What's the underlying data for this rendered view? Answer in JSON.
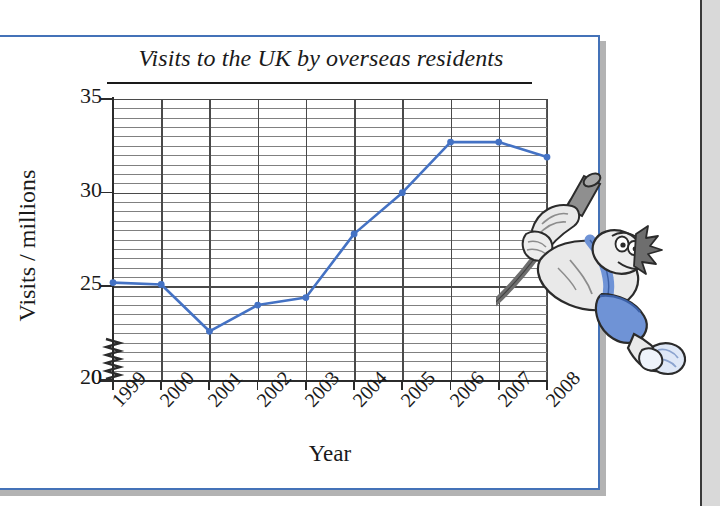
{
  "figure": {
    "border_color": "#4472b8",
    "shadow_color": "#b3b3b3",
    "background": "#ffffff"
  },
  "decoration": {
    "mascot_name": "pole-vaulter-cartoon",
    "mascot_colors": {
      "singlet": "#6f93d6",
      "shorts": "#6f93d6",
      "body": "#e8e8e8",
      "outline": "#2b2b2b",
      "pole": "#8a8a8a"
    }
  },
  "chart_data": {
    "type": "line",
    "title": "Visits to the UK by overseas residents",
    "xlabel": "Year",
    "ylabel": "Visits / millions",
    "categories": [
      "1999",
      "2000",
      "2001",
      "2002",
      "2003",
      "2004",
      "2005",
      "2006",
      "2007",
      "2008"
    ],
    "values": [
      25.2,
      25.1,
      22.6,
      24.0,
      24.4,
      27.8,
      30.0,
      32.7,
      32.7,
      31.9
    ],
    "series": [
      {
        "name": "Visits to the UK by overseas residents",
        "color": "#4472c4",
        "values": [
          25.2,
          25.1,
          22.6,
          24.0,
          24.4,
          27.8,
          30.0,
          32.7,
          32.7,
          31.9
        ]
      }
    ],
    "ylim": [
      20,
      35
    ],
    "y_major_ticks": [
      20,
      25,
      30,
      35
    ],
    "y_tick_labels": [
      "0",
      "20",
      "25",
      "30",
      "35"
    ],
    "y_minor_step": 0.5,
    "y_axis_break": true,
    "y_axis_break_note": "zigzag break between 0 and 20",
    "grid": true,
    "legend": "none",
    "marker": "circle",
    "line_color": "#4472c4"
  },
  "axis": {
    "y_labels": [
      "35",
      "30",
      "25",
      "20",
      "0"
    ],
    "x_labels": [
      "1999",
      "2000",
      "2001",
      "2002",
      "2003",
      "2004",
      "2005",
      "2006",
      "2007",
      "2008"
    ],
    "x_title": "Year",
    "y_title": "Visits / millions"
  }
}
